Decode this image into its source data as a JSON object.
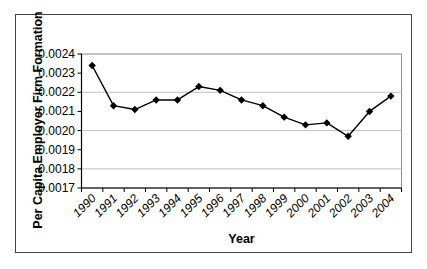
{
  "figure": {
    "background_color": "#ffffff",
    "frame_border_color": "#444444"
  },
  "chart_data": {
    "type": "line",
    "title": "",
    "xlabel": "Year",
    "ylabel": "Per Capita Employer Firm Formation",
    "categories": [
      "1990",
      "1991",
      "1992",
      "1993",
      "1994",
      "1995",
      "1996",
      "1997",
      "1998",
      "1999",
      "2000",
      "2001",
      "2002",
      "2003",
      "2004"
    ],
    "series": [
      {
        "name": "Per Capita Employer Firm Formation",
        "values": [
          0.00234,
          0.00213,
          0.00211,
          0.00216,
          0.00216,
          0.00223,
          0.00221,
          0.00216,
          0.00213,
          0.00207,
          0.00203,
          0.00204,
          0.00197,
          0.0021,
          0.00218
        ]
      }
    ],
    "ylim": [
      0.0017,
      0.0024
    ],
    "ytick_labels": [
      "0.0017",
      "0.0018",
      "0.0019",
      "0.0020",
      "0.0021",
      "0.0022",
      "0.0023",
      "0.0024"
    ],
    "gridlines_at": [
      0.0018,
      0.002,
      0.0022,
      0.0024
    ],
    "legend": "none",
    "grid_on": true,
    "colors": {
      "line": "#000000",
      "marker": "#000000",
      "grid": "#c0c0c0",
      "plot_border": "#909090",
      "axis": "#000000",
      "text": "#000000"
    },
    "marker_shape": "diamond",
    "xtick_label_rotation_deg": -45,
    "xtick_label_style": "italic"
  }
}
